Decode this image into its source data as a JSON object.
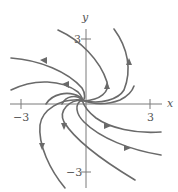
{
  "diagram": {
    "type": "phase-portrait",
    "axes": {
      "x_label": "x",
      "y_label": "y",
      "x_ticks": [
        {
          "value": -3,
          "label": "−3"
        },
        {
          "value": 3,
          "label": "3"
        }
      ],
      "y_ticks": [
        {
          "value": 3,
          "label": "3"
        },
        {
          "value": -3,
          "label": "−3"
        }
      ],
      "xlim": [
        -3.5,
        3.5
      ],
      "ylim": [
        -3.5,
        3.5
      ]
    },
    "trajectory_count": 9,
    "direction": "outward from origin, counterclockwise spiral"
  }
}
